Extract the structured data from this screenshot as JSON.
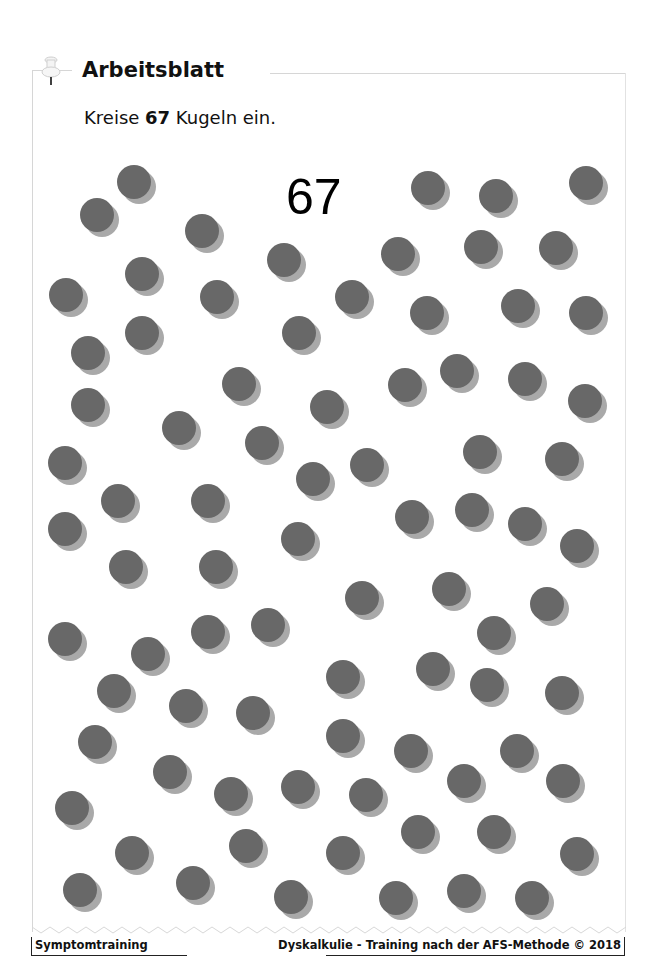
{
  "header": {
    "title": "Arbeitsblatt",
    "instruction_prefix": "Kreise ",
    "instruction_number": "67",
    "instruction_suffix": " Kugeln ein.",
    "pin_icon": "pushpin-icon"
  },
  "target_number": "67",
  "balls": {
    "count_shown": 82,
    "diameter": 34,
    "color": "#686868",
    "shadow_color": "#a9a9a9",
    "centers": [
      [
        134,
        182
      ],
      [
        97,
        215
      ],
      [
        202,
        231
      ],
      [
        428,
        188
      ],
      [
        496,
        196
      ],
      [
        586,
        183
      ],
      [
        284,
        260
      ],
      [
        398,
        254
      ],
      [
        481,
        247
      ],
      [
        556,
        248
      ],
      [
        142,
        274
      ],
      [
        66,
        295
      ],
      [
        217,
        297
      ],
      [
        352,
        297
      ],
      [
        427,
        313
      ],
      [
        518,
        306
      ],
      [
        586,
        313
      ],
      [
        142,
        333
      ],
      [
        299,
        333
      ],
      [
        88,
        353
      ],
      [
        239,
        384
      ],
      [
        405,
        385
      ],
      [
        457,
        371
      ],
      [
        525,
        379
      ],
      [
        88,
        405
      ],
      [
        327,
        407
      ],
      [
        585,
        401
      ],
      [
        179,
        428
      ],
      [
        262,
        443
      ],
      [
        480,
        452
      ],
      [
        562,
        459
      ],
      [
        65,
        463
      ],
      [
        313,
        479
      ],
      [
        367,
        465
      ],
      [
        118,
        501
      ],
      [
        208,
        501
      ],
      [
        412,
        517
      ],
      [
        472,
        510
      ],
      [
        525,
        524
      ],
      [
        65,
        529
      ],
      [
        298,
        539
      ],
      [
        577,
        546
      ],
      [
        126,
        567
      ],
      [
        216,
        567
      ],
      [
        362,
        598
      ],
      [
        449,
        589
      ],
      [
        547,
        604
      ],
      [
        65,
        639
      ],
      [
        208,
        632
      ],
      [
        268,
        625
      ],
      [
        494,
        633
      ],
      [
        148,
        654
      ],
      [
        343,
        677
      ],
      [
        433,
        669
      ],
      [
        487,
        685
      ],
      [
        562,
        693
      ],
      [
        114,
        691
      ],
      [
        186,
        706
      ],
      [
        253,
        713
      ],
      [
        95,
        742
      ],
      [
        343,
        736
      ],
      [
        411,
        751
      ],
      [
        517,
        751
      ],
      [
        170,
        772
      ],
      [
        464,
        781
      ],
      [
        563,
        781
      ],
      [
        231,
        794
      ],
      [
        298,
        787
      ],
      [
        366,
        795
      ],
      [
        72,
        808
      ],
      [
        132,
        853
      ],
      [
        246,
        846
      ],
      [
        418,
        832
      ],
      [
        494,
        832
      ],
      [
        343,
        853
      ],
      [
        577,
        854
      ],
      [
        80,
        890
      ],
      [
        193,
        883
      ],
      [
        291,
        897
      ],
      [
        396,
        898
      ],
      [
        464,
        891
      ],
      [
        532,
        898
      ]
    ]
  },
  "footer": {
    "left": "Symptomtraining",
    "right": "Dyskalkulie - Training nach der AFS-Methode © 2018"
  }
}
